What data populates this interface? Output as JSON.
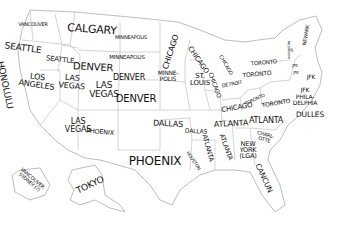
{
  "map": {
    "style": "hand-drawn xkcd-style US state map",
    "border_color": "#c9c9c9",
    "text_color": "#111111",
    "background": "#ffffff",
    "labels": [
      {
        "id": "wa-top",
        "text": "VANCOUVER",
        "x": 33,
        "y": 24,
        "size": 5,
        "rot": 0
      },
      {
        "id": "mt",
        "text": "CALGARY",
        "x": 92,
        "y": 30,
        "size": 11,
        "rot": 4
      },
      {
        "id": "nd",
        "text": "MINNEAPOLIS",
        "x": 131,
        "y": 37,
        "size": 5,
        "rot": 0
      },
      {
        "id": "mn",
        "text": "CHICAGO",
        "x": 171,
        "y": 52,
        "size": 8,
        "rot": -72
      },
      {
        "id": "wi",
        "text": "CHICAGO",
        "x": 198,
        "y": 60,
        "size": 7,
        "rot": 55
      },
      {
        "id": "wa",
        "text": "SEATTLE",
        "x": 23,
        "y": 48,
        "size": 9,
        "rot": 8
      },
      {
        "id": "id",
        "text": "SEATTLE",
        "x": 60,
        "y": 60,
        "size": 7,
        "rot": 6
      },
      {
        "id": "wy",
        "text": "DENVER",
        "x": 93,
        "y": 67,
        "size": 10,
        "rot": 3
      },
      {
        "id": "sd",
        "text": "MINNEAPOLIS",
        "x": 127,
        "y": 58,
        "size": 5.5,
        "rot": 0
      },
      {
        "id": "ca",
        "text": "LOS\nANGELES",
        "x": 37,
        "y": 81,
        "size": 8,
        "rot": 8
      },
      {
        "id": "hi",
        "text": "HONOLULU",
        "x": 5,
        "y": 85,
        "size": 9,
        "rot": 78
      },
      {
        "id": "nv",
        "text": "LAS\nVEGAS",
        "x": 72,
        "y": 82,
        "size": 8,
        "rot": 5
      },
      {
        "id": "ne",
        "text": "DENVER",
        "x": 129,
        "y": 78,
        "size": 8,
        "rot": 0
      },
      {
        "id": "ia",
        "text": "MINNE-\nPOLIS",
        "x": 168,
        "y": 76,
        "size": 6,
        "rot": 0
      },
      {
        "id": "mo",
        "text": "ST.\nLOUIS",
        "x": 200,
        "y": 80,
        "size": 7,
        "rot": 0
      },
      {
        "id": "il",
        "text": "CHICAGO",
        "x": 215,
        "y": 85,
        "size": 6,
        "rot": 70
      },
      {
        "id": "mi",
        "text": "CHICAGO",
        "x": 226,
        "y": 65,
        "size": 5,
        "rot": 60
      },
      {
        "id": "ut",
        "text": "LAS\nVEGAS",
        "x": 104,
        "y": 90,
        "size": 9,
        "rot": 0
      },
      {
        "id": "co",
        "text": "DENVER",
        "x": 136,
        "y": 99,
        "size": 10,
        "rot": 0
      },
      {
        "id": "in",
        "text": "DETROIT",
        "x": 232,
        "y": 84,
        "size": 5,
        "rot": -10
      },
      {
        "id": "oh",
        "text": "TORONTO",
        "x": 257,
        "y": 74,
        "size": 6,
        "rot": -5
      },
      {
        "id": "ny",
        "text": "TORONTO",
        "x": 264,
        "y": 63,
        "size": 5.5,
        "rot": -5
      },
      {
        "id": "vt",
        "text": "BURLINGTON\nJFK",
        "x": 291,
        "y": 50,
        "size": 3,
        "rot": -90
      },
      {
        "id": "me",
        "text": "NEWARK",
        "x": 306,
        "y": 35,
        "size": 5,
        "rot": -80
      },
      {
        "id": "ny2",
        "text": "JFK",
        "x": 295,
        "y": 66,
        "size": 4,
        "rot": 0
      },
      {
        "id": "ct",
        "text": "JFK",
        "x": 296,
        "y": 73,
        "size": 4,
        "rot": 0
      },
      {
        "id": "nj",
        "text": "JFK",
        "x": 311,
        "y": 77,
        "size": 6,
        "rot": 0
      },
      {
        "id": "de",
        "text": "JFK",
        "x": 305,
        "y": 90,
        "size": 6,
        "rot": 0
      },
      {
        "id": "pa",
        "text": "PHILA-\nDELPHIA",
        "x": 305,
        "y": 100,
        "size": 6,
        "rot": 0
      },
      {
        "id": "md",
        "text": "DULLES",
        "x": 310,
        "y": 115,
        "size": 7.5,
        "rot": 0
      },
      {
        "id": "ky",
        "text": "TORONTO",
        "x": 255,
        "y": 100,
        "size": 4.5,
        "rot": -25
      },
      {
        "id": "wv",
        "text": "TORONTO",
        "x": 276,
        "y": 103,
        "size": 6,
        "rot": -10
      },
      {
        "id": "ky2",
        "text": "CHICAGO",
        "x": 237,
        "y": 108,
        "size": 7,
        "rot": -10
      },
      {
        "id": "tn",
        "text": "ATLANTA",
        "x": 231,
        "y": 124,
        "size": 8,
        "rot": -3
      },
      {
        "id": "va",
        "text": "ATLANTA",
        "x": 266,
        "y": 121,
        "size": 8,
        "rot": 0
      },
      {
        "id": "nc",
        "text": "CHARL-\nOTTE",
        "x": 265,
        "y": 137,
        "size": 5,
        "rot": 15
      },
      {
        "id": "az",
        "text": "LAS\nVEGAS",
        "x": 78,
        "y": 126,
        "size": 8,
        "rot": 0
      },
      {
        "id": "nm",
        "text": "PHOENIX",
        "x": 100,
        "y": 132,
        "size": 6.5,
        "rot": 5
      },
      {
        "id": "ok",
        "text": "DALLAS",
        "x": 168,
        "y": 124,
        "size": 8,
        "rot": 3
      },
      {
        "id": "ar",
        "text": "DALLAS",
        "x": 196,
        "y": 131,
        "size": 6,
        "rot": 3
      },
      {
        "id": "ms",
        "text": "ATLANTA",
        "x": 208,
        "y": 148,
        "size": 6.5,
        "rot": 75
      },
      {
        "id": "al",
        "text": "ATLANTA",
        "x": 226,
        "y": 147,
        "size": 6.5,
        "rot": 70
      },
      {
        "id": "ga",
        "text": "NEW\nYORK\n(LGA)",
        "x": 248,
        "y": 150,
        "size": 6.5,
        "rot": 0
      },
      {
        "id": "la",
        "text": "HOUSTON",
        "x": 193,
        "y": 161,
        "size": 4.5,
        "rot": 55
      },
      {
        "id": "tx",
        "text": "PHOENIX",
        "x": 155,
        "y": 162,
        "size": 12,
        "rot": 0
      },
      {
        "id": "fl",
        "text": "CANCUN",
        "x": 264,
        "y": 178,
        "size": 7.5,
        "rot": 65
      },
      {
        "id": "hi2",
        "text": "VANCOUVER\nSYDNEY (?)",
        "x": 31,
        "y": 180,
        "size": 5,
        "rot": 40
      },
      {
        "id": "ak",
        "text": "TOKYO",
        "x": 90,
        "y": 185,
        "size": 9,
        "rot": -25
      }
    ]
  }
}
